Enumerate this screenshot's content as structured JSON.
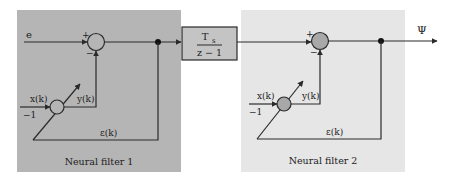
{
  "diagram": {
    "colors": {
      "filter1_bg": "#b5b5b5",
      "filter2_bg": "#e6e6e6",
      "block_bg": "#c4c4c4",
      "line": "#2a2a2a"
    },
    "input_label": "e",
    "output_label": "Ψ",
    "block": {
      "numerator": "T",
      "numerator_sub": "s",
      "denominator": "z − 1"
    },
    "filters": [
      {
        "title": "Neural filter 1",
        "sum_plus": "+",
        "sum_minus": "−",
        "x_label": "x(k)",
        "bias_label": "−1",
        "y_label": "y(k)",
        "error_label": "ε(k)"
      },
      {
        "title": "Neural filter 2",
        "sum_plus": "+",
        "sum_minus": "−",
        "x_label": "x(k)",
        "bias_label": "−1",
        "y_label": "y(k)",
        "error_label": "ε(k)"
      }
    ]
  }
}
